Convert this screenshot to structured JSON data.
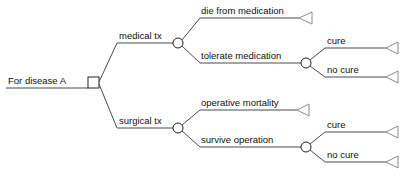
{
  "diagram": {
    "type": "decision-tree",
    "title": "For disease A",
    "colors": {
      "line": "#4a4a4a",
      "node_stroke": "#222222",
      "node_fill": "#ffffff",
      "terminal_stroke": "#8a8a8a",
      "text": "#111111",
      "background": "#ffffff"
    },
    "root": {
      "label": "For disease A",
      "node_type": "decision-square"
    },
    "branches": [
      {
        "id": "medical",
        "label": "medical tx",
        "node_type": "chance-circle",
        "outcomes": [
          {
            "id": "die-from-medication",
            "label": "die from medication",
            "node_type": "terminal-triangle",
            "outcomes": []
          },
          {
            "id": "tolerate-medication",
            "label": "tolerate medication",
            "node_type": "chance-circle",
            "outcomes": [
              {
                "id": "medical-cure",
                "label": "cure",
                "node_type": "terminal-triangle"
              },
              {
                "id": "medical-no-cure",
                "label": "no cure",
                "node_type": "terminal-triangle"
              }
            ]
          }
        ]
      },
      {
        "id": "surgical",
        "label": "surgical tx",
        "node_type": "chance-circle",
        "outcomes": [
          {
            "id": "operative-mortality",
            "label": "operative mortality",
            "node_type": "terminal-triangle",
            "outcomes": []
          },
          {
            "id": "survive-operation",
            "label": "survive operation",
            "node_type": "chance-circle",
            "outcomes": [
              {
                "id": "surgical-cure",
                "label": "cure",
                "node_type": "terminal-triangle"
              },
              {
                "id": "surgical-no-cure",
                "label": "no cure",
                "node_type": "terminal-triangle"
              }
            ]
          }
        ]
      }
    ]
  }
}
